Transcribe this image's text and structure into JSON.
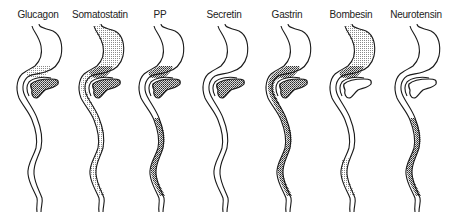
{
  "legend": {
    "light_dots": "moderate density",
    "dense_dots": "high density",
    "stomach": "stomach",
    "pancreas": "pancreas",
    "intestine": "small intestine / colon"
  },
  "colors": {
    "outline": "#1a1a1a",
    "background": "#ffffff",
    "dots": "#333333"
  },
  "figures": [
    {
      "label": "Glucagon",
      "x": 5,
      "stomach_fundus": "none",
      "stomach_antrum": "light",
      "pancreas": "dense",
      "duodenum": "none",
      "intestine_upper": "none",
      "intestine_lower": "none"
    },
    {
      "label": "Somatostatin",
      "x": 67,
      "stomach_fundus": "light",
      "stomach_antrum": "dense",
      "pancreas": "dense",
      "duodenum": "light",
      "intestine_upper": "light",
      "intestine_lower": "light"
    },
    {
      "label": "PP",
      "x": 127,
      "stomach_fundus": "none",
      "stomach_antrum": "dense",
      "pancreas": "dense",
      "duodenum": "none",
      "intestine_upper": "none",
      "intestine_lower": "dense"
    },
    {
      "label": "Secretin",
      "x": 191,
      "stomach_fundus": "none",
      "stomach_antrum": "none",
      "pancreas": "dense",
      "duodenum": "none",
      "intestine_upper": "none",
      "intestine_lower": "none"
    },
    {
      "label": "Gastrin",
      "x": 254,
      "stomach_fundus": "none",
      "stomach_antrum": "dense",
      "pancreas": "dense",
      "duodenum": "dense",
      "intestine_upper": "dense",
      "intestine_lower": "dense"
    },
    {
      "label": "Bombesin",
      "x": 318,
      "stomach_fundus": "light",
      "stomach_antrum": "dense",
      "pancreas": "none",
      "duodenum": "none",
      "intestine_upper": "none",
      "intestine_lower": "light_partial"
    },
    {
      "label": "Neurotensin",
      "x": 383,
      "stomach_fundus": "none",
      "stomach_antrum": "none",
      "pancreas": "none",
      "duodenum": "none",
      "intestine_upper": "none",
      "intestine_lower": "dense"
    }
  ]
}
